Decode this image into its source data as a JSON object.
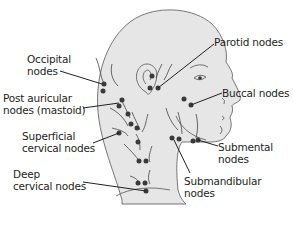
{
  "colors": {
    "skin": "#e6e6e6",
    "outline": "#555555",
    "node": "#3a3a3a",
    "text": "#231f20"
  },
  "labels": {
    "occipital": "Occipital\nnodes",
    "post_auricular": "Post auricular\nnodes (mastoid)",
    "superficial_cervical": "Superficial\ncervical nodes",
    "deep_cervical": "Deep\ncervical nodes",
    "parotid": "Parotid nodes",
    "buccal": "Buccal nodes",
    "submental": "Submental\nnodes",
    "submandibular": "Submandibular\nnodes"
  }
}
